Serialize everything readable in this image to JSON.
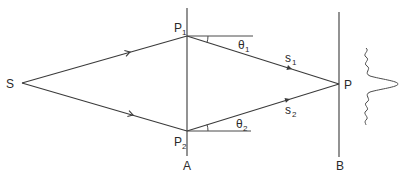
{
  "diagram": {
    "type": "two-path interference geometry",
    "labels": {
      "source": "S",
      "point1": "P",
      "point1_sub": "1",
      "point2": "P",
      "point2_sub": "2",
      "screen_point": "P",
      "plane_a": "A",
      "plane_b": "B",
      "angle1": "θ",
      "angle1_sub": "1",
      "angle2": "θ",
      "angle2_sub": "2",
      "path1": "s",
      "path1_sub": "1",
      "path2": "s",
      "path2_sub": "2"
    },
    "nodes": [
      {
        "id": "S",
        "x": 22,
        "y": 83
      },
      {
        "id": "P1",
        "x": 187,
        "y": 36
      },
      {
        "id": "P2",
        "x": 187,
        "y": 131
      },
      {
        "id": "P",
        "x": 339,
        "y": 84
      }
    ],
    "edges": [
      {
        "from": "S",
        "to": "P1",
        "arrow": true
      },
      {
        "from": "S",
        "to": "P2",
        "arrow": true
      },
      {
        "from": "P1",
        "to": "P",
        "arrow": true,
        "label": "s1"
      },
      {
        "from": "P2",
        "to": "P",
        "arrow": true,
        "label": "s2"
      }
    ],
    "planes": [
      {
        "id": "A",
        "x": 187
      },
      {
        "id": "B",
        "x": 339
      }
    ],
    "intensity_pattern": "central maximum with decaying side fringes",
    "line_color": "#3a3a3a"
  }
}
